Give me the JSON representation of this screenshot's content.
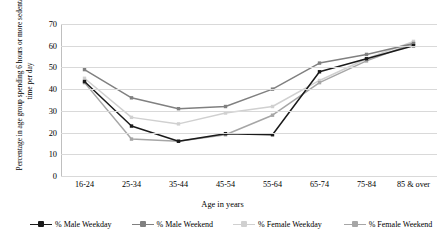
{
  "chart_data": {
    "type": "line",
    "title": "",
    "xlabel": "Age in years",
    "ylabel": "Percentage in age group spending  6 hours or more sedentary time per day",
    "categories": [
      "16-24",
      "25-34",
      "35-44",
      "45-54",
      "55-64",
      "65-74",
      "75-84",
      "85 & over"
    ],
    "ylim": [
      0,
      70
    ],
    "yticks": [
      0,
      10,
      20,
      30,
      40,
      50,
      60,
      70
    ],
    "grid": true,
    "legend_position": "bottom",
    "series": [
      {
        "name": "% Male Weekday",
        "color": "#1a1a1a",
        "values": [
          43.5,
          23,
          16,
          19.5,
          19,
          48,
          54,
          60
        ]
      },
      {
        "name": "% Male Weekend",
        "color": "#808080",
        "values": [
          49,
          36,
          31,
          32,
          40,
          52,
          56,
          61
        ]
      },
      {
        "name": "% Female Weekday",
        "color": "#d0d0d0",
        "values": [
          45,
          27,
          24,
          29,
          32,
          44,
          54,
          62
        ]
      },
      {
        "name": "% Female Weekend",
        "color": "#a6a6a6",
        "values": [
          43,
          17,
          16,
          19,
          28,
          43,
          53,
          61
        ]
      }
    ]
  },
  "axis": {
    "y_title": "Percentage in age group spending  6 hours or more sedentary time per day",
    "x_title": "Age in years",
    "y_tick_labels": [
      "70",
      "60",
      "50",
      "40",
      "30",
      "20",
      "10",
      "0"
    ],
    "x_tick_labels": [
      "16-24",
      "25-34",
      "35-44",
      "45-54",
      "55-64",
      "65-74",
      "75-84",
      "85 & over"
    ]
  },
  "legend": {
    "items": [
      {
        "label": "% Male Weekday",
        "color": "#1a1a1a"
      },
      {
        "label": "% Male Weekend",
        "color": "#808080"
      },
      {
        "label": "% Female Weekday",
        "color": "#d0d0d0"
      },
      {
        "label": "% Female Weekend",
        "color": "#a6a6a6"
      }
    ]
  },
  "colors": {
    "gridline": "#d9d9d9",
    "axis": "#bfbfbf",
    "background": "#ffffff",
    "text": "#000000"
  }
}
